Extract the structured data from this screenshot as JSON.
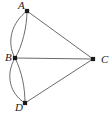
{
  "figure": {
    "kind": "graph-diagram",
    "width": 110,
    "height": 118,
    "background_color": "#ffffff",
    "edge_color": "#6b6b6b",
    "vertex_color": "#1a1a1a",
    "label_color": "#1a1a1a"
  },
  "vertices": [
    {
      "id": "A",
      "label": "A",
      "x": 27,
      "y": 11,
      "label_x": 18,
      "label_y": 6
    },
    {
      "id": "B",
      "label": "B",
      "x": 15,
      "y": 58,
      "label_x": 5,
      "label_y": 58
    },
    {
      "id": "C",
      "label": "C",
      "x": 93,
      "y": 59,
      "label_x": 101,
      "label_y": 60
    },
    {
      "id": "D",
      "label": "D",
      "x": 25,
      "y": 103,
      "label_x": 15,
      "label_y": 108
    }
  ],
  "edges": [
    {
      "id": "AB-arc-left",
      "from": "A",
      "to": "B",
      "type": "arc",
      "bulge": "left",
      "path": "M 27 11 C 12 22, 6 42, 15 58"
    },
    {
      "id": "AB-arc-right",
      "from": "A",
      "to": "B",
      "type": "arc",
      "bulge": "right",
      "path": "M 27 11 C 27 27, 22 47, 15 58"
    },
    {
      "id": "BD-arc-left",
      "from": "B",
      "to": "D",
      "type": "arc",
      "bulge": "left",
      "path": "M 15 58 C 5 75, 10 94, 25 103"
    },
    {
      "id": "BD-arc-right",
      "from": "B",
      "to": "D",
      "type": "arc",
      "bulge": "right",
      "path": "M 15 58 C 22 72, 25 88, 25 103"
    },
    {
      "id": "AC",
      "from": "A",
      "to": "C",
      "type": "line",
      "path": "M 27 11 L 93 59"
    },
    {
      "id": "BC",
      "from": "B",
      "to": "C",
      "type": "line",
      "path": "M 15 58 L 93 59"
    },
    {
      "id": "DC",
      "from": "D",
      "to": "C",
      "type": "line",
      "path": "M 25 103 L 93 59"
    }
  ],
  "chart_data": {
    "type": "graph",
    "title": "",
    "nodes": [
      "A",
      "B",
      "C",
      "D"
    ],
    "node_positions": {
      "A": [
        27,
        11
      ],
      "B": [
        15,
        58
      ],
      "C": [
        93,
        59
      ],
      "D": [
        25,
        103
      ]
    },
    "edges": [
      {
        "source": "A",
        "target": "B",
        "multiplicity": 2,
        "style": "curved"
      },
      {
        "source": "B",
        "target": "D",
        "multiplicity": 2,
        "style": "curved"
      },
      {
        "source": "A",
        "target": "C",
        "multiplicity": 1,
        "style": "straight"
      },
      {
        "source": "B",
        "target": "C",
        "multiplicity": 1,
        "style": "straight"
      },
      {
        "source": "D",
        "target": "C",
        "multiplicity": 1,
        "style": "straight"
      }
    ],
    "directed": false,
    "edge_count": 7,
    "node_count": 4
  }
}
